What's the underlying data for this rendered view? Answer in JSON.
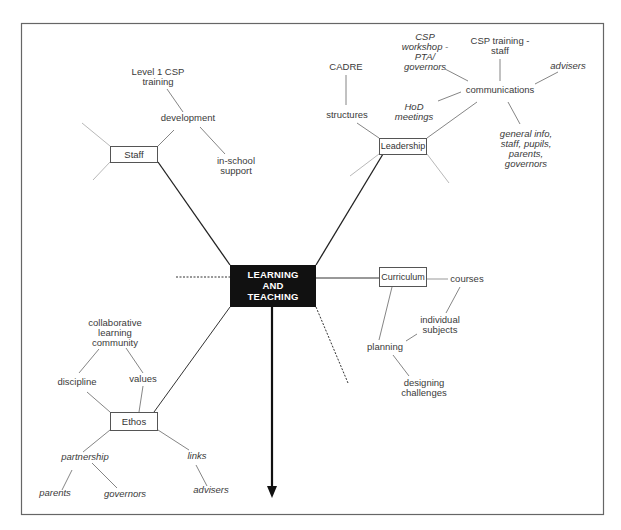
{
  "diagram": {
    "type": "mind-map",
    "center": {
      "label": "LEARNING\nAND\nTEACHING",
      "fill": "#111111",
      "text_color": "#ffffff"
    },
    "branches": {
      "staff": {
        "label": "Staff",
        "children": {
          "development": "development",
          "level1": "Level 1 CSP\ntraining",
          "inschool": "in-school\nsupport"
        }
      },
      "leadership": {
        "label": "Leadership",
        "children": {
          "structures": "structures",
          "cadre": "CADRE",
          "communications": "communications",
          "workshop": "CSP\nworkshop -\nPTA/\ngovernors",
          "training": "CSP training -\nstaff",
          "advisers": "advisers",
          "hod": "HoD\nmeetings",
          "general": "general info,\nstaff, pupils,\nparents,\ngovernors"
        }
      },
      "curriculum": {
        "label": "Curriculum",
        "children": {
          "courses": "courses",
          "individual": "individual\nsubjects",
          "planning": "planning",
          "designing": "designing\nchallenges"
        }
      },
      "ethos": {
        "label": "Ethos",
        "children": {
          "collaborative": "collaborative\nlearning\ncommunity",
          "discipline": "discipline",
          "values": "values",
          "partnership": "partnership",
          "links": "links",
          "parents": "parents",
          "governors": "governors",
          "advisers": "advisers"
        }
      }
    },
    "colors": {
      "frame": "#666666",
      "line": "#555555",
      "thick_line": "#222222",
      "faint_line": "#999999"
    }
  }
}
